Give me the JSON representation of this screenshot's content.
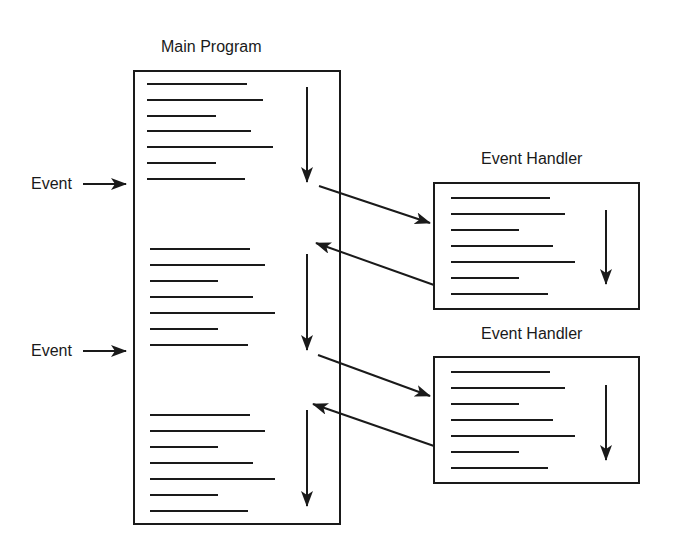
{
  "diagram": {
    "main_program": {
      "title": "Main Program"
    },
    "events": [
      {
        "label": "Event"
      },
      {
        "label": "Event"
      }
    ],
    "handlers": [
      {
        "title": "Event Handler"
      },
      {
        "title": "Event Handler"
      }
    ],
    "colors": {
      "stroke": "#1a1a1a",
      "background": "#ffffff"
    }
  }
}
